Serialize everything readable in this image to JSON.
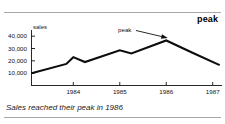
{
  "slide": {
    "title": "peak",
    "caption": "Sales reached their peak in 1986"
  },
  "chart_data": {
    "type": "line",
    "title": "peak",
    "xlabel": "",
    "ylabel": "sales",
    "y_unit_label": "sales",
    "ytick_labels": [
      "40,000",
      "30,000",
      "20,000",
      "10,000"
    ],
    "ytick_values": [
      40000,
      30000,
      20000,
      10000
    ],
    "ylim": [
      0,
      45000
    ],
    "xtick_labels": [
      "1984",
      "1985",
      "1986",
      "1987"
    ],
    "xtick_values": [
      1984,
      1985,
      1986,
      1987
    ],
    "xlim": [
      1983.1,
      1987.2
    ],
    "grid": false,
    "legend": "none",
    "series": [
      {
        "name": "sales",
        "x": [
          1983.1,
          1983.85,
          1984.0,
          1984.25,
          1985.0,
          1985.25,
          1986.0,
          1986.6,
          1987.15
        ],
        "values": [
          10000,
          17500,
          23000,
          19000,
          28500,
          26000,
          36500,
          26000,
          16500
        ]
      }
    ],
    "annotations": [
      {
        "label": "peak",
        "target_x": 1986.0,
        "target_y": 36500,
        "arrow": "down-right"
      }
    ]
  }
}
